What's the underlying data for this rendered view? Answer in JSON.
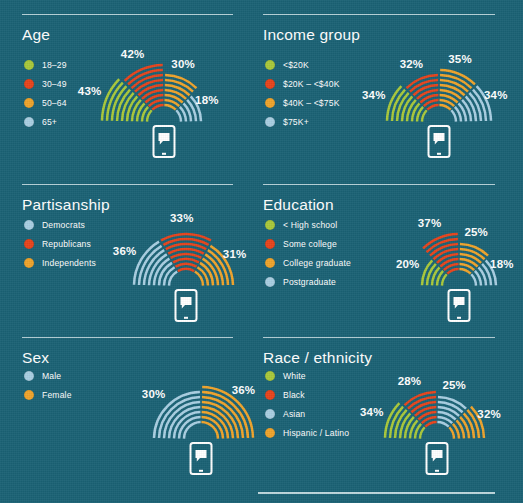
{
  "background_color": "#1b6275",
  "palette": {
    "green": "#a9c93a",
    "red": "#e8441c",
    "orange": "#f0a42b",
    "blue": "#a9cfe2",
    "white": "#ffffff",
    "rule": "#cfe3e8"
  },
  "bottom_rule": true,
  "panels": [
    {
      "id": "age",
      "title": "Age",
      "legend": [
        {
          "label": "18–29",
          "color": "#a9c93a"
        },
        {
          "label": "30–49",
          "color": "#e8441c"
        },
        {
          "label": "50–64",
          "color": "#f0a42b"
        },
        {
          "label": "65+",
          "color": "#a9cfe2"
        }
      ],
      "segments": [
        {
          "label": "18–29",
          "value": 43,
          "display": "43%",
          "color": "#a9c93a"
        },
        {
          "label": "30–49",
          "value": 42,
          "display": "42%",
          "color": "#e8441c"
        },
        {
          "label": "50–64",
          "value": 30,
          "display": "30%",
          "color": "#f0a42b"
        },
        {
          "label": "65+",
          "value": 18,
          "display": "18%",
          "color": "#a9cfe2"
        }
      ]
    },
    {
      "id": "income-group",
      "title": "Income group",
      "legend": [
        {
          "label": "<$20K",
          "color": "#a9c93a"
        },
        {
          "label": "$20K – <$40K",
          "color": "#e8441c"
        },
        {
          "label": "$40K – <$75K",
          "color": "#f0a42b"
        },
        {
          "label": "$75K+",
          "color": "#a9cfe2"
        }
      ],
      "segments": [
        {
          "label": "<$20K",
          "value": 34,
          "display": "34%",
          "color": "#a9c93a"
        },
        {
          "label": "$20K – <$40K",
          "value": 32,
          "display": "32%",
          "color": "#e8441c"
        },
        {
          "label": "$40K – <$75K",
          "value": 35,
          "display": "35%",
          "color": "#f0a42b"
        },
        {
          "label": "$75K+",
          "value": 34,
          "display": "34%",
          "color": "#a9cfe2"
        }
      ]
    },
    {
      "id": "partisanship",
      "title": "Partisanship",
      "legend": [
        {
          "label": "Democrats",
          "color": "#a9cfe2"
        },
        {
          "label": "Republicans",
          "color": "#e8441c"
        },
        {
          "label": "Independents",
          "color": "#f0a42b"
        }
      ],
      "segments": [
        {
          "label": "Democrats",
          "value": 36,
          "display": "36%",
          "color": "#a9cfe2"
        },
        {
          "label": "Republicans",
          "value": 33,
          "display": "33%",
          "color": "#e8441c"
        },
        {
          "label": "Independents",
          "value": 31,
          "display": "31%",
          "color": "#f0a42b"
        }
      ]
    },
    {
      "id": "education",
      "title": "Education",
      "legend": [
        {
          "label": "< High school",
          "color": "#a9c93a"
        },
        {
          "label": "Some college",
          "color": "#e8441c"
        },
        {
          "label": "College graduate",
          "color": "#f0a42b"
        },
        {
          "label": "Postgraduate",
          "color": "#a9cfe2"
        }
      ],
      "segments": [
        {
          "label": "< High school",
          "value": 20,
          "display": "20%",
          "color": "#a9c93a"
        },
        {
          "label": "Some college",
          "value": 37,
          "display": "37%",
          "color": "#e8441c"
        },
        {
          "label": "College graduate",
          "value": 25,
          "display": "25%",
          "color": "#f0a42b"
        },
        {
          "label": "Postgraduate",
          "value": 18,
          "display": "18%",
          "color": "#a9cfe2"
        }
      ]
    },
    {
      "id": "sex",
      "title": "Sex",
      "legend": [
        {
          "label": "Male",
          "color": "#a9cfe2"
        },
        {
          "label": "Female",
          "color": "#f0a42b"
        }
      ],
      "segments": [
        {
          "label": "Male",
          "value": 30,
          "display": "30%",
          "color": "#a9cfe2"
        },
        {
          "label": "Female",
          "value": 36,
          "display": "36%",
          "color": "#f0a42b"
        }
      ]
    },
    {
      "id": "race-ethnicity",
      "title": "Race / ethnicity",
      "legend": [
        {
          "label": "White",
          "color": "#a9c93a"
        },
        {
          "label": "Black",
          "color": "#e8441c"
        },
        {
          "label": "Asian",
          "color": "#a9cfe2"
        },
        {
          "label": "Hispanic / Latino",
          "color": "#f0a42b"
        }
      ],
      "segments": [
        {
          "label": "White",
          "value": 34,
          "display": "34%",
          "color": "#a9c93a"
        },
        {
          "label": "Black",
          "value": 28,
          "display": "28%",
          "color": "#e8441c"
        },
        {
          "label": "Asian",
          "value": 25,
          "display": "25%",
          "color": "#a9cfe2"
        },
        {
          "label": "Hispanic / Latino",
          "value": 32,
          "display": "32%",
          "color": "#f0a42b"
        }
      ]
    }
  ],
  "chart_data": {
    "type": "bar",
    "note": "Radial fan charts; each segment's arc count/radius encodes the percent.",
    "charts": [
      {
        "group": "Age",
        "categories": [
          "18–29",
          "30–49",
          "50–64",
          "65+"
        ],
        "values": [
          43,
          42,
          30,
          18
        ]
      },
      {
        "group": "Income group",
        "categories": [
          "<$20K",
          "$20K – <$40K",
          "$40K – <$75K",
          "$75K+"
        ],
        "values": [
          34,
          32,
          35,
          34
        ]
      },
      {
        "group": "Partisanship",
        "categories": [
          "Democrats",
          "Republicans",
          "Independents"
        ],
        "values": [
          36,
          33,
          31
        ]
      },
      {
        "group": "Education",
        "categories": [
          "< High school",
          "Some college",
          "College graduate",
          "Postgraduate"
        ],
        "values": [
          20,
          37,
          25,
          18
        ]
      },
      {
        "group": "Sex",
        "categories": [
          "Male",
          "Female"
        ],
        "values": [
          30,
          36
        ]
      },
      {
        "group": "Race / ethnicity",
        "categories": [
          "White",
          "Black",
          "Asian",
          "Hispanic / Latino"
        ],
        "values": [
          34,
          28,
          25,
          32
        ]
      }
    ],
    "ylabel": "Percent",
    "ylim": [
      0,
      50
    ],
    "grid": false,
    "legend_position": "left"
  }
}
